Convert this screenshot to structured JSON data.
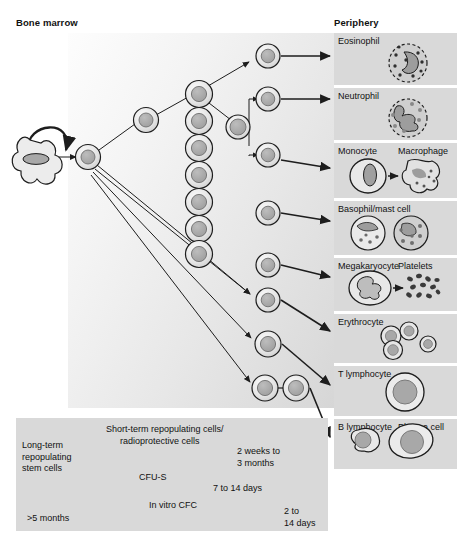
{
  "headings": {
    "bone_marrow": "Bone marrow",
    "periphery": "Periphery"
  },
  "colors": {
    "panel_bg": "#d9d9d9",
    "cell_ring": "#e2e2e2",
    "cell_nucleus": "#a8a8a8",
    "stroke": "#2b2b2b",
    "field_light": "#fdfdfd",
    "field_dark": "#d6d6d6",
    "bar_dark": "#2b2b2b",
    "page_bg": "#ffffff"
  },
  "periphery_panels": [
    {
      "id": "eosinophil",
      "labels": [
        "Eosinophil"
      ],
      "top": 33,
      "height": 52
    },
    {
      "id": "neutrophil",
      "labels": [
        "Neutrophil"
      ],
      "top": 88,
      "height": 52
    },
    {
      "id": "monocyte",
      "labels": [
        "Monocyte",
        "Macrophage"
      ],
      "top": 143,
      "height": 55
    },
    {
      "id": "basophil",
      "labels": [
        "Basophil/mast cell"
      ],
      "top": 201,
      "height": 54
    },
    {
      "id": "megakaryocyte",
      "labels": [
        "Megakaryocyte",
        "Platelets"
      ],
      "top": 258,
      "height": 53
    },
    {
      "id": "erythrocyte",
      "labels": [
        "Erythrocyte"
      ],
      "top": 314,
      "height": 49
    },
    {
      "id": "t-lymphocyte",
      "labels": [
        "T lymphocyte"
      ],
      "top": 366,
      "height": 50
    },
    {
      "id": "b-lymphocyte",
      "labels": [
        "B lymphocyte",
        "Plasma cell"
      ],
      "top": 419,
      "height": 50
    }
  ],
  "timeline": {
    "left_labels": [
      {
        "id": "long-term",
        "lines": [
          "Long-term",
          "repopulating",
          "stem cells"
        ]
      },
      {
        "id": "five-months",
        "text": ">5 months"
      }
    ],
    "rows": [
      {
        "id": "row-short-term",
        "marker_label_lines": [
          "Short-term repopulating cells/",
          "radioprotective cells"
        ],
        "duration_lines": [
          "2 weeks to",
          "3 months"
        ]
      },
      {
        "id": "row-cfu-s",
        "marker_label": "CFU-S",
        "duration": "7 to 14 days"
      },
      {
        "id": "row-cfc",
        "marker_label_italic": "In vitro",
        "marker_label_rest": "CFC",
        "duration_lines": [
          "2 to",
          "14 days"
        ]
      }
    ]
  },
  "icons": {
    "self_renewal": "self-renewal-arrow-icon",
    "flow_arrow": "flow-arrow-icon",
    "marker": "triangle-marker-icon"
  }
}
